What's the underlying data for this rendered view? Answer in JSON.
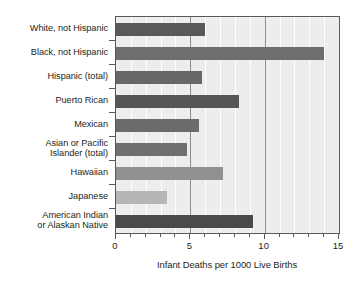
{
  "chart_data": {
    "type": "bar",
    "orientation": "horizontal",
    "title": "",
    "xlabel": "Infant Deaths per 1000 Live Births",
    "ylabel": "",
    "xlim": [
      0,
      15
    ],
    "xticks": [
      0,
      5,
      10,
      15
    ],
    "xticklabels": [
      "0",
      "5",
      "10",
      "15"
    ],
    "minor_gridlines": [
      1,
      2,
      3,
      4,
      6,
      7,
      8,
      9,
      11,
      12,
      13,
      14
    ],
    "major_gridlines": [
      5,
      10
    ],
    "grid": true,
    "legend": "none",
    "plot_background": "#ededed",
    "categories": [
      "White, not Hispanic",
      "Black, not Hispanic",
      "Hispanic (total)",
      "Puerto Rican",
      "Mexican",
      "Asian or Pacific Islander (total)",
      "Hawaiian",
      "Japanese",
      "American Indian or Alaskan Native"
    ],
    "category_lines": [
      [
        "White, not Hispanic"
      ],
      [
        "Black, not Hispanic"
      ],
      [
        "Hispanic (total)"
      ],
      [
        "Puerto Rican"
      ],
      [
        "Mexican"
      ],
      [
        "Asian or Pacific",
        "Islander (total)"
      ],
      [
        "Hawaiian"
      ],
      [
        "Japanese"
      ],
      [
        "American Indian",
        "or Alaskan Native"
      ]
    ],
    "values": [
      6.0,
      14.0,
      5.8,
      8.3,
      5.6,
      4.8,
      7.2,
      3.4,
      9.2
    ],
    "bar_colors": [
      "#595959",
      "#6e6e6e",
      "#676767",
      "#565656",
      "#6b6b6b",
      "#6f6f6f",
      "#919191",
      "#b6b6b6",
      "#4a4a4a"
    ]
  }
}
